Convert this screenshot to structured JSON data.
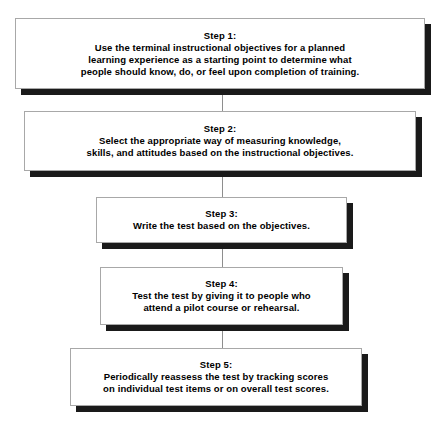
{
  "diagram": {
    "type": "flowchart",
    "orientation": "vertical",
    "background_color": "#ffffff",
    "box_fill_color": "#ffffff",
    "box_border_color": "#a8a8a8",
    "shadow_color": "#1a1a1a",
    "connector_color": "#8e8e8e",
    "text_color": "#000000",
    "steps": [
      {
        "title": "Step 1:",
        "lines": [
          "Use the terminal instructional objectives for a planned",
          "learning experience as a starting point to determine what",
          "people should know, do, or feel upon completion of training."
        ]
      },
      {
        "title": "Step 2:",
        "lines": [
          "Select the appropriate way of measuring knowledge,",
          "skills, and attitudes based on the instructional objectives."
        ]
      },
      {
        "title": "Step 3:",
        "lines": [
          "Write the test based on the objectives."
        ]
      },
      {
        "title": "Step 4:",
        "lines": [
          "Test the test by giving it to people who",
          "attend a pilot course or rehearsal."
        ]
      },
      {
        "title": "Step 5:",
        "lines": [
          "Periodically reassess the test by tracking scores",
          "on individual test items or on overall test scores."
        ]
      }
    ]
  }
}
